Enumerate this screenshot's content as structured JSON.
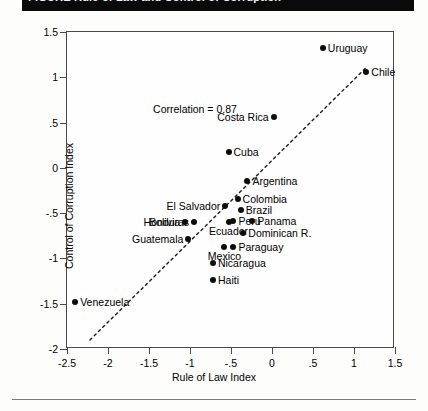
{
  "titlebar": {
    "text": "FIGURE  Rule of Law and Control of Corruption"
  },
  "chart_data": {
    "type": "scatter",
    "title": "",
    "xlabel": "Rule of Law Index",
    "ylabel": "Control of Corruption Index",
    "xlim": [
      -2.5,
      1.5
    ],
    "ylim": [
      -2,
      1.5
    ],
    "xticks": [
      "-2.5",
      "-2",
      "-1.5",
      "-1",
      "-.5",
      "0",
      ".5",
      "1",
      "1.5"
    ],
    "xtick_values": [
      -2.5,
      -2,
      -1.5,
      -1,
      -0.5,
      0,
      0.5,
      1,
      1.5
    ],
    "yticks": [
      "1.5",
      "1",
      ".5",
      "0",
      "-.5",
      "-1",
      "-1.5",
      "-2"
    ],
    "ytick_values": [
      1.5,
      1,
      0.5,
      0,
      -0.5,
      -1,
      -1.5,
      -2
    ],
    "grid": false,
    "legend": "none",
    "annotation": "Correlation = 0.87",
    "annotation_x": -1.45,
    "annotation_y": 0.72,
    "trendline": {
      "style": "dashed",
      "x0": -2.22,
      "y0": -1.9,
      "x1": 1.14,
      "y1": 1.1
    },
    "points": [
      {
        "label": "Uruguay",
        "x": 0.62,
        "y": 1.32,
        "pos": "right"
      },
      {
        "label": "Chile",
        "x": 1.15,
        "y": 1.06,
        "pos": "right"
      },
      {
        "label": "Costa Rica",
        "x": 0.02,
        "y": 0.56,
        "pos": "left"
      },
      {
        "label": "Cuba",
        "x": -0.53,
        "y": 0.18,
        "pos": "right"
      },
      {
        "label": "Argentina",
        "x": -0.3,
        "y": -0.14,
        "pos": "right"
      },
      {
        "label": "Colombia",
        "x": -0.42,
        "y": -0.34,
        "pos": "right"
      },
      {
        "label": "Brazil",
        "x": -0.38,
        "y": -0.47,
        "pos": "right"
      },
      {
        "label": "El Salvador",
        "x": -0.57,
        "y": -0.42,
        "pos": "left"
      },
      {
        "label": "Peru",
        "x": -0.47,
        "y": -0.59,
        "pos": "right"
      },
      {
        "label": "Ecuador",
        "x": -0.53,
        "y": -0.6,
        "pos": "below"
      },
      {
        "label": "Panama",
        "x": -0.24,
        "y": -0.59,
        "pos": "right"
      },
      {
        "label": "Honduras",
        "x": -0.95,
        "y": -0.6,
        "pos": "left"
      },
      {
        "label": "Bolivia",
        "x": -1.06,
        "y": -0.6,
        "pos": "left"
      },
      {
        "label": "Dominican R.",
        "x": -0.35,
        "y": -0.72,
        "pos": "right"
      },
      {
        "label": "Guatemala",
        "x": -1.02,
        "y": -0.79,
        "pos": "left"
      },
      {
        "label": "Paraguay",
        "x": -0.47,
        "y": -0.87,
        "pos": "right"
      },
      {
        "label": "Mexico",
        "x": -0.58,
        "y": -0.87,
        "pos": "below"
      },
      {
        "label": "Nicaragua",
        "x": -0.72,
        "y": -1.05,
        "pos": "right"
      },
      {
        "label": "Haiti",
        "x": -0.72,
        "y": -1.24,
        "pos": "right"
      },
      {
        "label": "Venezuela",
        "x": -2.4,
        "y": -1.48,
        "pos": "right"
      }
    ]
  }
}
